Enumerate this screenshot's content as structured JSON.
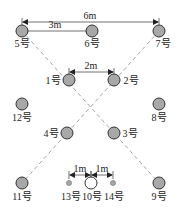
{
  "diagram": {
    "type": "borehole-layout",
    "dimensions": [
      {
        "id": "d6m",
        "label": "6m",
        "x1": 22,
        "x2": 159,
        "y": 22,
        "label_x": 90,
        "label_y": 19
      },
      {
        "id": "d3m",
        "label": "3m",
        "x1": 22,
        "x2": 92,
        "y": 31,
        "label_x": 55,
        "label_y": 28
      },
      {
        "id": "d2m",
        "label": "2m",
        "x1": 69,
        "x2": 114,
        "y": 72,
        "label_x": 91,
        "label_y": 69
      },
      {
        "id": "d1m_left",
        "label": "1m",
        "x1": 69,
        "x2": 91,
        "y": 175,
        "label_x": 80,
        "label_y": 172
      },
      {
        "id": "d1m_right",
        "label": "1m",
        "x1": 91,
        "x2": 113,
        "y": 175,
        "label_x": 102,
        "label_y": 172
      }
    ],
    "holes": [
      {
        "id": "5",
        "label": "5号",
        "x": 22,
        "y": 31,
        "r": 6,
        "style": "filled",
        "label_x": 22,
        "label_y": 47
      },
      {
        "id": "6",
        "label": "6号",
        "x": 92,
        "y": 31,
        "r": 6,
        "style": "filled",
        "label_x": 92,
        "label_y": 47
      },
      {
        "id": "7",
        "label": "7号",
        "x": 159,
        "y": 31,
        "r": 6,
        "style": "filled",
        "label_x": 163,
        "label_y": 47
      },
      {
        "id": "1",
        "label": "1号",
        "x": 69,
        "y": 80,
        "r": 6,
        "style": "filled",
        "label_x": 53,
        "label_y": 84
      },
      {
        "id": "2",
        "label": "2号",
        "x": 114,
        "y": 80,
        "r": 6,
        "style": "filled",
        "label_x": 131,
        "label_y": 84
      },
      {
        "id": "12",
        "label": "12号",
        "x": 22,
        "y": 104,
        "r": 6,
        "style": "filled",
        "label_x": 22,
        "label_y": 121
      },
      {
        "id": "8",
        "label": "8号",
        "x": 159,
        "y": 104,
        "r": 6,
        "style": "filled",
        "label_x": 159,
        "label_y": 121
      },
      {
        "id": "4",
        "label": "4号",
        "x": 67,
        "y": 133,
        "r": 6,
        "style": "filled",
        "label_x": 51,
        "label_y": 137
      },
      {
        "id": "3",
        "label": "3号",
        "x": 114,
        "y": 133,
        "r": 6,
        "style": "filled",
        "label_x": 130,
        "label_y": 137
      },
      {
        "id": "11",
        "label": "11号",
        "x": 22,
        "y": 183,
        "r": 6,
        "style": "filled",
        "label_x": 22,
        "label_y": 200
      },
      {
        "id": "13",
        "label": "13号",
        "x": 69,
        "y": 183,
        "r": 2.5,
        "style": "small",
        "label_x": 71,
        "label_y": 200
      },
      {
        "id": "10",
        "label": "10号",
        "x": 91,
        "y": 183,
        "r": 6,
        "style": "hollow",
        "label_x": 92,
        "label_y": 200
      },
      {
        "id": "14",
        "label": "14号",
        "x": 113,
        "y": 183,
        "r": 2.5,
        "style": "small",
        "label_x": 114,
        "label_y": 200
      },
      {
        "id": "9",
        "label": "9号",
        "x": 159,
        "y": 183,
        "r": 6,
        "style": "filled",
        "label_x": 159,
        "label_y": 200
      }
    ],
    "dashed_lines": [
      {
        "from": "5",
        "to": "9",
        "x1": 22,
        "y1": 31,
        "x2": 159,
        "y2": 183
      },
      {
        "from": "7",
        "to": "11",
        "x1": 159,
        "y1": 31,
        "x2": 22,
        "y2": 183
      }
    ],
    "colors": {
      "hole_fill": "#a8a8a8",
      "hole_stroke": "#333333",
      "dash_line": "#9a9a9a",
      "dim_line": "#333333"
    }
  }
}
